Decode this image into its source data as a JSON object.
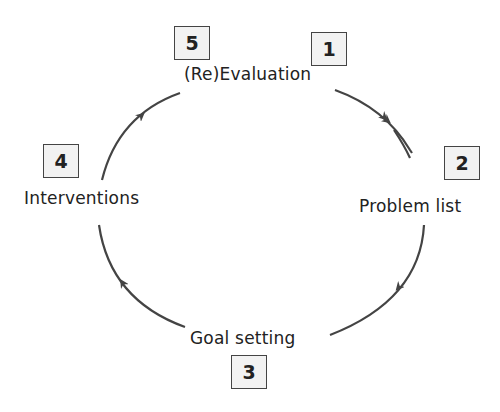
{
  "diagram": {
    "type": "cycle",
    "direction": "clockwise",
    "arc_color": "#444444",
    "steps": [
      {
        "number": "1",
        "label": "(Re)Evaluation"
      },
      {
        "number": "2",
        "label": "Problem list"
      },
      {
        "number": "3",
        "label": "Goal setting"
      },
      {
        "number": "4",
        "label": "Interventions"
      },
      {
        "number": "5",
        "label": "(Re)Evaluation"
      }
    ],
    "nodes": {
      "top": {
        "label": "(Re)Evaluation",
        "badges": [
          "5",
          "1"
        ]
      },
      "right": {
        "label": "Problem list",
        "badge": "2"
      },
      "bottom": {
        "label": "Goal setting",
        "badge": "3"
      },
      "left": {
        "label": "Interventions",
        "badge": "4"
      }
    }
  }
}
